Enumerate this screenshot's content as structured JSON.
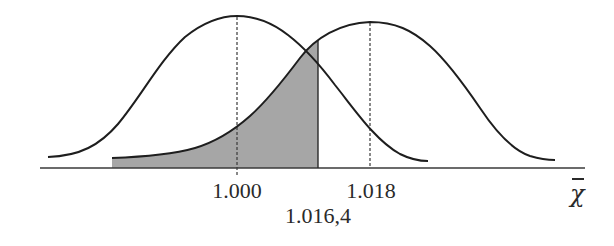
{
  "diagram": {
    "type": "two-normal-curves-hypothesis-test",
    "colors": {
      "curve": "#1e1e1e",
      "axis": "#3a3a3a",
      "shade": "#a6a6a6",
      "dashed": "#3a3a3a",
      "text": "#2a2a2a"
    },
    "curves": [
      {
        "name": "null-distribution",
        "mean_label": "1.000"
      },
      {
        "name": "alternative-distribution",
        "mean_label": "1.018"
      }
    ],
    "critical_value_label": "1.016,4",
    "axis_label": "χ",
    "shaded_region": "area under alternative curve left of critical value"
  }
}
